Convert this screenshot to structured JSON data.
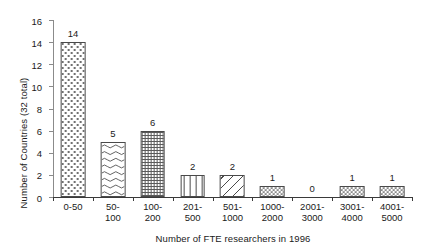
{
  "chart_data": {
    "type": "bar",
    "title": "",
    "xlabel": "Number of FTE researchers in 1996",
    "ylabel": "Number of Countries (32 total)",
    "categories": [
      "0-50",
      "50-100",
      "100-200",
      "201-500",
      "501-1000",
      "1000-2000",
      "2001-3000",
      "3001-4000",
      "4001-5000"
    ],
    "category_labels": [
      "0-50",
      "50-100",
      "100-200",
      "201-500",
      "501-1000",
      "1000-\n2000",
      "2001-\n3000",
      "3001-\n4000",
      "4001-\n5000"
    ],
    "values": [
      14,
      5,
      6,
      2,
      2,
      1,
      0,
      1,
      1
    ],
    "value_labels": [
      "14",
      "5",
      "6",
      "2",
      "2",
      "1",
      "0",
      "1",
      "1"
    ],
    "patterns": [
      "dots",
      "wave",
      "grid",
      "vertical-lines",
      "diagonal-hatch",
      "checkerboard",
      "none",
      "checkerboard",
      "checkerboard"
    ],
    "ylim": [
      0,
      16
    ],
    "yticks": [
      0,
      2,
      4,
      6,
      8,
      10,
      12,
      14,
      16
    ],
    "ytick_labels": [
      "0",
      "2",
      "4",
      "6",
      "8",
      "10",
      "12",
      "14",
      "16"
    ],
    "grid": false,
    "legend": false,
    "bar_edge_color": "#4a4a4a",
    "axis_color": "#3a3a3a",
    "text_color": "#1a1a1a",
    "background_color": "#ffffff"
  }
}
